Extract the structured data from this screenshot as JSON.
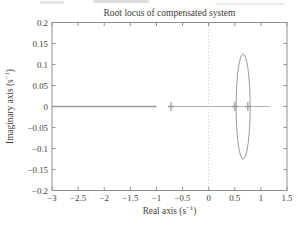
{
  "figure": {
    "title": "Root locus of compensated system"
  },
  "axes": {
    "x": {
      "label_pre": "Real axis (s",
      "label_sup": "−1",
      "label_post": ")",
      "tick_labels": [
        "−3",
        "−2.5",
        "−2",
        "−1.5",
        "−1",
        "−0.5",
        "0",
        "0.5",
        "1",
        "1.5"
      ],
      "tick_values": [
        -3,
        -2.5,
        -2,
        -1.5,
        -1,
        -0.5,
        0,
        0.5,
        1,
        1.5
      ]
    },
    "y": {
      "label_pre": "Imaginary axis (s",
      "label_sup": "−1",
      "label_post": ")",
      "tick_labels": [
        "0.2",
        "0.15",
        "0.1",
        "0.05",
        "0",
        "−0.05",
        "−0.1",
        "−0.15",
        "−0.2"
      ],
      "tick_values": [
        0.2,
        0.15,
        0.1,
        0.05,
        0,
        -0.05,
        -0.1,
        -0.15,
        -0.2
      ]
    }
  },
  "chart_data": {
    "type": "line",
    "subtype": "root-locus",
    "title": "Root locus of compensated system",
    "xlabel": "Real axis (s^-1)",
    "ylabel": "Imaginary axis (s^-1)",
    "xlim": [
      -3,
      1.5
    ],
    "ylim": [
      -0.2,
      0.2
    ],
    "grid": false,
    "legend": false,
    "reference_lines": [
      {
        "type": "vertical",
        "x": 0,
        "style": "dotted"
      }
    ],
    "series": [
      {
        "name": "real-axis-branch-left",
        "style": "solid",
        "weight": "dark",
        "points": [
          [
            -3.0,
            0
          ],
          [
            -1.0,
            0
          ]
        ]
      },
      {
        "name": "real-axis-branch-right",
        "style": "solid",
        "weight": "light",
        "points": [
          [
            -0.78,
            0
          ],
          [
            1.17,
            0
          ]
        ]
      },
      {
        "name": "circular-branch",
        "shape": "ellipse",
        "center": [
          0.66,
          0
        ],
        "rx": 0.134,
        "ry": 0.125
      }
    ],
    "markers": [
      {
        "x": -0.72,
        "y": 0,
        "style": "cross"
      },
      {
        "x": 0.5,
        "y": 0,
        "style": "cross"
      },
      {
        "x": 0.75,
        "y": 0,
        "style": "cross"
      }
    ]
  },
  "style": {
    "axis_color": "#909090",
    "locus_dark": "#9a9a9a",
    "locus_light": "#b4b4b4",
    "marker_color": "#9a9a9a",
    "dotted_color": "#c6c6c6",
    "text_color": "#3d3d3d",
    "background": "#ffffff"
  }
}
